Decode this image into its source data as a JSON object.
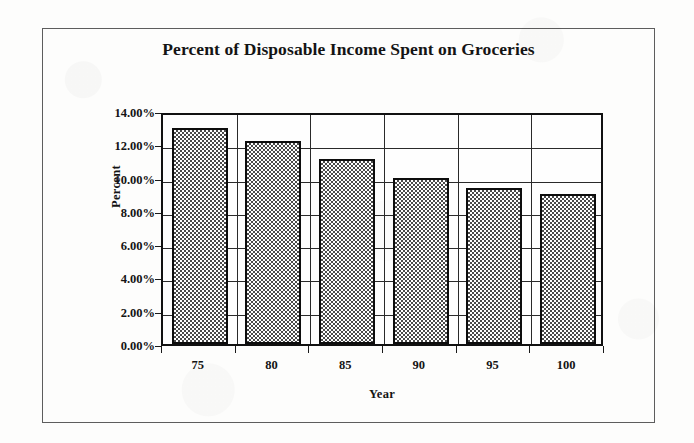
{
  "chart_data": {
    "type": "bar",
    "title": "Percent of Disposable Income Spent on Groceries",
    "xlabel": "Year",
    "ylabel": "Percent",
    "categories": [
      "75",
      "80",
      "85",
      "90",
      "95",
      "100"
    ],
    "values": [
      13.0,
      12.2,
      11.1,
      10.0,
      9.35,
      9.0
    ],
    "value_labels": [
      "13.00%",
      "12.20%",
      "11.10%",
      "10.00%",
      "9.35%",
      "9.00%"
    ],
    "ylim": [
      0,
      14
    ],
    "ytick_values": [
      0,
      2,
      4,
      6,
      8,
      10,
      12,
      14
    ],
    "ytick_labels": [
      "0.00%",
      "2.00%",
      "4.00%",
      "6.00%",
      "8.00%",
      "10.00%",
      "12.00%",
      "14.00%"
    ],
    "grid": "both",
    "legend": "none",
    "series": [
      {
        "name": "Percent of Disposable Income Spent on Groceries",
        "values": [
          13.0,
          12.2,
          11.1,
          10.0,
          9.35,
          9.0
        ]
      }
    ],
    "bar_fill": "checkerboard-gray",
    "bar_outline_color": "#0d0d0d",
    "axis_color": "#1a1a1a",
    "plot_background": "#fefefe",
    "frame_color": "#5d5d5d"
  }
}
